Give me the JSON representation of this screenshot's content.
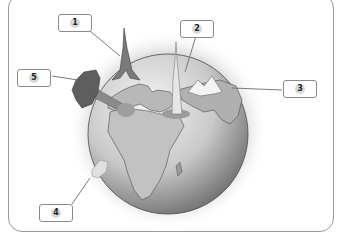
{
  "diagram": {
    "title": "",
    "labels": [
      {
        "id": "label-1",
        "text": "1",
        "points_to": "eiffel-tower"
      },
      {
        "id": "label-2",
        "text": "2",
        "points_to": "tall-skyscraper"
      },
      {
        "id": "label-3",
        "text": "3",
        "points_to": "mountain-range"
      },
      {
        "id": "label-4",
        "text": "4",
        "points_to": "baby-bottle"
      },
      {
        "id": "label-5",
        "text": "5",
        "points_to": "tree"
      }
    ],
    "colors": {
      "frame": "#9a9a9a",
      "globe_light": "#f2f2f2",
      "globe_dark": "#6e6e6e",
      "land_outline": "#4a4a4a"
    }
  }
}
